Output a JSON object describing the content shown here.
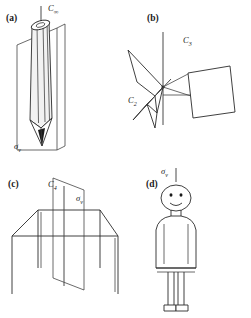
{
  "figure": {
    "background_color": "#ffffff",
    "line_color": "#2b2b2b",
    "width": 251,
    "height": 318
  },
  "panels": [
    {
      "id": "a",
      "label": "(a)",
      "object": "pencil",
      "description": "A sharpened pencil standing vertically inside a vertical mirror plane",
      "symmetry_labels": [
        {
          "name": "rotation-axis",
          "base": "C",
          "subscript": "∞",
          "text": "C∞"
        },
        {
          "name": "mirror-plane",
          "base": "σ",
          "subscript": "v",
          "text": "σv"
        }
      ]
    },
    {
      "id": "b",
      "label": "(b)",
      "object": "propeller",
      "description": "A three-bladed propeller with a principal three-fold axis and a two-fold axis",
      "symmetry_labels": [
        {
          "name": "rotation-axis-principal",
          "base": "C",
          "subscript": "3",
          "text": "C3"
        },
        {
          "name": "rotation-axis-secondary",
          "base": "C",
          "subscript": "2",
          "text": "C2"
        }
      ]
    },
    {
      "id": "c",
      "label": "(c)",
      "object": "table",
      "description": "A square table with a vertical four-fold axis and a vertical mirror plane",
      "symmetry_labels": [
        {
          "name": "rotation-axis",
          "base": "C",
          "subscript": "4",
          "text": "C4"
        },
        {
          "name": "mirror-plane",
          "base": "σ",
          "subscript": "v",
          "text": "σv"
        }
      ]
    },
    {
      "id": "d",
      "label": "(d)",
      "object": "person",
      "description": "A standing human figure bisected by a vertical mirror plane",
      "symmetry_labels": [
        {
          "name": "mirror-plane",
          "base": "σ",
          "subscript": "v",
          "text": "σv"
        }
      ]
    }
  ],
  "labels": {
    "panel_a": "(a)",
    "panel_b": "(b)",
    "panel_c": "(c)",
    "panel_d": "(d)",
    "c_infinity": "C",
    "c_infinity_sub": "∞",
    "sigma_v_a": "σ",
    "sigma_v_a_sub": "v",
    "c3": "C",
    "c3_sub": "3",
    "c2": "C",
    "c2_sub": "2",
    "c4": "C",
    "c4_sub": "4",
    "sigma_v_c": "σ",
    "sigma_v_c_sub": "v",
    "sigma_v_d": "σ",
    "sigma_v_d_sub": "v"
  }
}
